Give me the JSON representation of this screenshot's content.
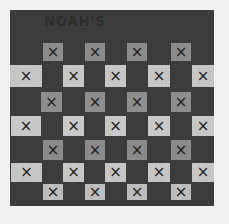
{
  "photo": {
    "description": "Photograph of a dark checkerboard craft board with light squares marked with X",
    "title": "NOAH'S",
    "colors": {
      "background": "#f2f2f2",
      "board": "#3c3c3c",
      "medium_square": "#8a8a8a",
      "light_square": "#c4c4c4",
      "mark": "#1e1e1e"
    },
    "mark": "×",
    "rows": [
      {
        "y": 43,
        "h": 18,
        "shade": "#8c8c8c",
        "squares": [
          {
            "x": 43,
            "w": 20
          },
          {
            "x": 85,
            "w": 20
          },
          {
            "x": 127,
            "w": 20
          },
          {
            "x": 171,
            "w": 20
          }
        ]
      },
      {
        "y": 65,
        "h": 22,
        "shade": "#c6c6c6",
        "squares": [
          {
            "x": 10,
            "w": 32
          },
          {
            "x": 63,
            "w": 21
          },
          {
            "x": 105,
            "w": 21
          },
          {
            "x": 148,
            "w": 22
          },
          {
            "x": 192,
            "w": 22
          }
        ]
      },
      {
        "y": 92,
        "h": 20,
        "shade": "#8e8e8e",
        "squares": [
          {
            "x": 41,
            "w": 21
          },
          {
            "x": 85,
            "w": 20
          },
          {
            "x": 127,
            "w": 20
          },
          {
            "x": 171,
            "w": 20
          }
        ]
      },
      {
        "y": 116,
        "h": 20,
        "shade": "#c8c8c8",
        "squares": [
          {
            "x": 11,
            "w": 30
          },
          {
            "x": 63,
            "w": 21
          },
          {
            "x": 105,
            "w": 21
          },
          {
            "x": 148,
            "w": 22
          },
          {
            "x": 192,
            "w": 22
          }
        ]
      },
      {
        "y": 140,
        "h": 20,
        "shade": "#8a8a8a",
        "squares": [
          {
            "x": 43,
            "w": 20
          },
          {
            "x": 85,
            "w": 20
          },
          {
            "x": 127,
            "w": 20
          },
          {
            "x": 171,
            "w": 20
          }
        ]
      },
      {
        "y": 163,
        "h": 19,
        "shade": "#c6c6c6",
        "squares": [
          {
            "x": 11,
            "w": 31
          },
          {
            "x": 63,
            "w": 21
          },
          {
            "x": 105,
            "w": 21
          },
          {
            "x": 148,
            "w": 22
          },
          {
            "x": 192,
            "w": 22
          }
        ]
      },
      {
        "y": 184,
        "h": 16,
        "shade": "#bdbdbd",
        "squares": [
          {
            "x": 43,
            "w": 20
          },
          {
            "x": 85,
            "w": 20
          },
          {
            "x": 127,
            "w": 20
          },
          {
            "x": 171,
            "w": 20
          }
        ]
      }
    ]
  }
}
